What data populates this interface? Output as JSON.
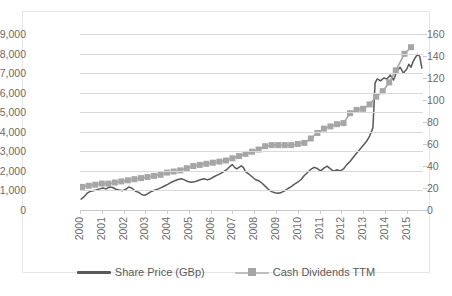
{
  "chart_data": {
    "type": "line",
    "title": "",
    "subtitle": "",
    "xlabel": "",
    "ylabel": "",
    "y2label": "",
    "grid": true,
    "legend_position": "bottom",
    "xlim": [
      2000,
      2015.75
    ],
    "ylim": [
      0,
      9000
    ],
    "y2lim": [
      0,
      160
    ],
    "y_ticks": [
      "0",
      "1,000",
      "2,000",
      "3,000",
      "4,000",
      "5,000",
      "6,000",
      "7,000",
      "8,000",
      "9,000"
    ],
    "y_tick_values": [
      0,
      1000,
      2000,
      3000,
      4000,
      5000,
      6000,
      7000,
      8000,
      9000
    ],
    "y2_ticks": [
      "0",
      "20",
      "40",
      "60",
      "80",
      "100",
      "120",
      "140",
      "160"
    ],
    "y2_tick_values": [
      0,
      20,
      40,
      60,
      80,
      100,
      120,
      140,
      160
    ],
    "x_ticks": [
      "2000",
      "2001",
      "2002",
      "2003",
      "2004",
      "2005",
      "2006",
      "2007",
      "2008",
      "2009",
      "2010",
      "2011",
      "2012",
      "2013",
      "2014",
      "2015"
    ],
    "x_tick_values": [
      2000,
      2001,
      2002,
      2003,
      2004,
      2005,
      2006,
      2007,
      2008,
      2009,
      2010,
      2011,
      2012,
      2013,
      2014,
      2015
    ],
    "series": [
      {
        "name": "Share Price (GBp)",
        "axis": "left",
        "color": "#595959",
        "marker": "none",
        "x": [
          2000.05,
          2000.15,
          2000.25,
          2000.35,
          2000.45,
          2000.6,
          2000.75,
          2000.9,
          2001.05,
          2001.2,
          2001.35,
          2001.5,
          2001.65,
          2001.8,
          2001.95,
          2002.1,
          2002.25,
          2002.4,
          2002.55,
          2002.7,
          2002.85,
          2003.0,
          2003.15,
          2003.3,
          2003.45,
          2003.6,
          2003.75,
          2003.9,
          2004.05,
          2004.2,
          2004.35,
          2004.5,
          2004.65,
          2004.8,
          2004.95,
          2005.1,
          2005.25,
          2005.4,
          2005.55,
          2005.7,
          2005.85,
          2006.0,
          2006.15,
          2006.3,
          2006.45,
          2006.6,
          2006.75,
          2006.9,
          2007.0,
          2007.1,
          2007.2,
          2007.3,
          2007.4,
          2007.5,
          2007.6,
          2007.75,
          2007.9,
          2008.05,
          2008.2,
          2008.35,
          2008.5,
          2008.65,
          2008.8,
          2008.95,
          2009.1,
          2009.25,
          2009.4,
          2009.55,
          2009.7,
          2009.85,
          2010.0,
          2010.15,
          2010.3,
          2010.45,
          2010.6,
          2010.75,
          2010.9,
          2011.05,
          2011.2,
          2011.35,
          2011.5,
          2011.65,
          2011.8,
          2011.95,
          2012.1,
          2012.25,
          2012.4,
          2012.55,
          2012.7,
          2012.85,
          2013.0,
          2013.15,
          2013.3,
          2013.45,
          2013.55,
          2013.65,
          2013.8,
          2013.95,
          2014.1,
          2014.25,
          2014.4,
          2014.55,
          2014.7,
          2014.85,
          2015.0,
          2015.1,
          2015.2,
          2015.3,
          2015.4,
          2015.5,
          2015.6,
          2015.7
        ],
        "y": [
          560,
          640,
          760,
          880,
          940,
          980,
          1020,
          1080,
          1120,
          1080,
          1180,
          1150,
          1060,
          1020,
          990,
          1060,
          1180,
          1100,
          960,
          900,
          780,
          760,
          860,
          960,
          1020,
          1080,
          1160,
          1240,
          1320,
          1420,
          1500,
          1560,
          1600,
          1540,
          1460,
          1420,
          1440,
          1500,
          1560,
          1600,
          1540,
          1600,
          1700,
          1780,
          1860,
          1960,
          2080,
          2240,
          2320,
          2180,
          2100,
          2180,
          2260,
          2180,
          1960,
          1840,
          1700,
          1560,
          1500,
          1380,
          1220,
          1060,
          940,
          880,
          860,
          900,
          980,
          1100,
          1200,
          1320,
          1420,
          1560,
          1760,
          1920,
          2080,
          2180,
          2120,
          2000,
          2140,
          2240,
          2100,
          1980,
          2060,
          2000,
          2100,
          2320,
          2480,
          2700,
          2900,
          3100,
          3300,
          3500,
          3780,
          4200,
          6500,
          6700,
          6600,
          6750,
          6700,
          6900,
          6650,
          7100,
          7300,
          7000,
          7200,
          7450,
          7300,
          7600,
          7800,
          7960,
          7850,
          7250
        ]
      },
      {
        "name": "Cash Dividends TTM",
        "axis": "right",
        "color": "#a6a6a6",
        "marker": "square",
        "x": [
          2000.1,
          2000.4,
          2000.7,
          2001.0,
          2001.3,
          2001.6,
          2001.9,
          2002.2,
          2002.5,
          2002.8,
          2003.1,
          2003.4,
          2003.7,
          2004.0,
          2004.3,
          2004.6,
          2004.9,
          2005.2,
          2005.5,
          2005.8,
          2006.1,
          2006.4,
          2006.7,
          2007.0,
          2007.3,
          2007.6,
          2007.9,
          2008.2,
          2008.5,
          2008.8,
          2009.1,
          2009.4,
          2009.7,
          2010.0,
          2010.3,
          2010.6,
          2010.9,
          2011.2,
          2011.5,
          2011.8,
          2012.1,
          2012.4,
          2012.7,
          2013.0,
          2013.3,
          2013.6,
          2013.9,
          2014.2,
          2014.5,
          2014.9,
          2015.2
        ],
        "y": [
          21,
          22,
          23,
          24,
          24,
          25,
          26,
          27,
          28,
          29,
          30,
          31,
          32,
          34,
          35,
          36,
          38,
          40,
          41,
          42,
          43,
          44,
          45,
          47,
          49,
          51,
          53,
          55,
          58,
          59,
          59,
          59,
          59,
          60,
          61,
          65,
          70,
          74,
          76,
          78,
          79,
          88,
          91,
          92,
          96,
          103,
          108,
          116,
          127,
          142,
          148
        ]
      }
    ]
  },
  "legend": {
    "items": [
      {
        "label": "Share Price (GBp)",
        "color": "#595959",
        "style": "line"
      },
      {
        "label": "Cash Dividends TTM",
        "color": "#a6a6a6",
        "style": "line-marker"
      }
    ]
  },
  "colors": {
    "share_price": "#595959",
    "dividends": "#a6a6a6",
    "gridline": "#d9d9d9",
    "axis_text": "#6b6b6b",
    "frame": "#e6e6e6"
  }
}
